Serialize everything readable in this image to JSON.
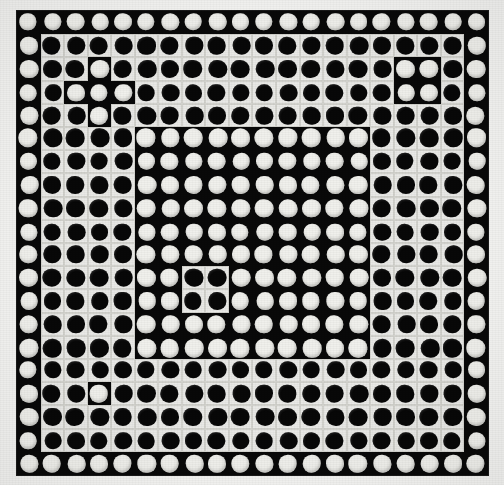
{
  "figure": {
    "type": "binary-dot-matrix",
    "rows": 20,
    "cols": 20,
    "colors": {
      "tile_black": "#090909",
      "tile_white": "#e9e9e6",
      "dot_black": "#080808",
      "dot_white": "#f0f0ec",
      "grid_line": "#d2d2cd",
      "paper": "#f4f4f2"
    },
    "legend": {
      "symbol_white_on_black": "W",
      "symbol_black_on_white": "B"
    },
    "band_structure": [
      "ring 0 (outermost, rows/cols 0 and 19): white discs on black",
      "ring 1 (rows/cols 1-4 band): black discs on white",
      "ring 2 (rows/cols 5-9 band): white discs on black",
      "ring 3 (rows/cols 10-14 region): white discs on black interior",
      "ring 4 (rows/cols 15-18 band): black discs on white"
    ],
    "anomalies": [
      {
        "name": "top-left-cross",
        "cells": "r2c3, r3c2, r3c3, r3c4, r4c3",
        "value": "W inside B band"
      },
      {
        "name": "top-right-pair",
        "cells": "r2c16, r2c17, r3c16, r3c17",
        "value": "W inside B band"
      },
      {
        "name": "center-quad",
        "cells": "r11c7, r11c8, r12c7, r12c8",
        "value": "B inside W field"
      },
      {
        "name": "bottom-right-quad",
        "cells": "r11c15, r11c16, r12c15, r12c16",
        "value": "B inside W band"
      },
      {
        "name": "bottom-left-single",
        "cells": "r16c3",
        "value": "W inside B band"
      }
    ]
  },
  "matrix": [
    "WWWWWWWWWWWWWWWWWWWW",
    "WBBBBBBBBBBBBBBBBBBW",
    "WBBWBBBBBBBBBBBBWWBW",
    "WBWWWBBBBBBBBBBBWWBW",
    "WBBWBBBBBBBBBBBBBBBW",
    "WBBBBWWWWWWWWWWBBBBW",
    "WBBBBWWWWWWWWWWBBBBW",
    "WBBBBWWWWWWWWWWBBBBW",
    "WBBBBWWWWWWWWWWBBBBW",
    "WBBBBWWWWWWWWWWBBBBW",
    "WBBBBWWWWWWWWWWBBBBW",
    "WBBBBWWBBWWWWWWBBBBW",
    "WBBBBWWBBWWWWWWBBBBW",
    "WBBBBWWWWWWWWWWBBBBW",
    "WBBBBWWWWWWWWWWBBBBW",
    "WBBBBBBBBBBBBBBBBBBW",
    "WBBWBBBBBBBBBBBBBBBW",
    "WBBBBBBBBBBBBBBBBBBW",
    "WBBBBBBBBBBBBBBBBBBW",
    "WWWWWWWWWWWWWWWWWWWW"
  ]
}
